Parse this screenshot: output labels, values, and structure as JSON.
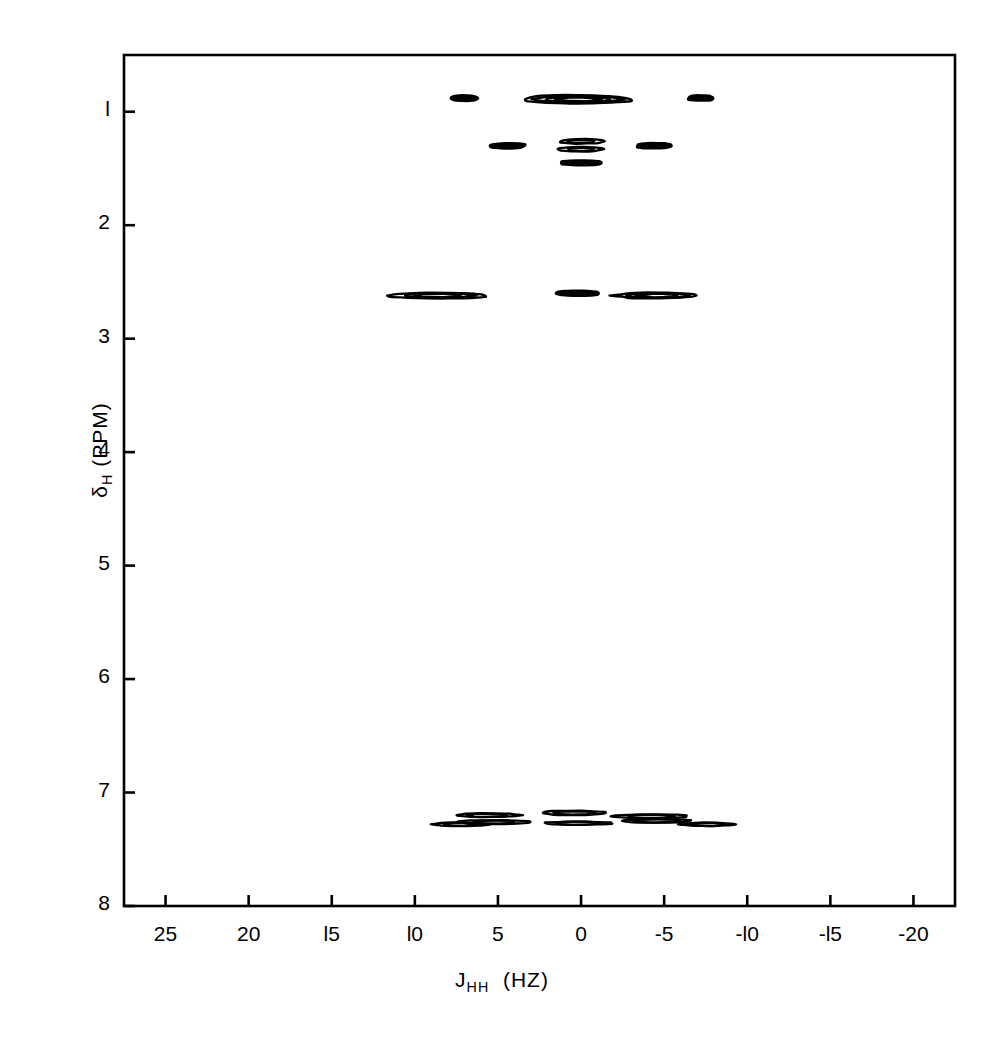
{
  "figure": {
    "domain": "chart",
    "background_color": "#ffffff",
    "line_color": "#000000"
  },
  "chart_data": {
    "type": "heatmap",
    "subtype": "2d-contour-nmr-j-resolved",
    "title": "",
    "subtitle": "",
    "xlabel_parts": {
      "symbol": "J",
      "subscript": "HH",
      "units": "(HZ)"
    },
    "xlabel": "J_HH (HZ)",
    "ylabel_parts": {
      "symbol": "δ",
      "subscript": "H",
      "units": "(PPM)"
    },
    "ylabel": "δ_H (PPM)",
    "xlim": [
      27.5,
      -22.5
    ],
    "ylim": [
      0.5,
      8.0
    ],
    "x_inverted": true,
    "y_inverted": true,
    "grid": false,
    "legend": false,
    "xticks": [
      25,
      20,
      15,
      10,
      5,
      0,
      -5,
      -10,
      -15,
      -20
    ],
    "xticklabels": [
      "25",
      "20",
      "l5",
      "l0",
      "5",
      "0",
      "-5",
      "-l0",
      "-l5",
      "-20"
    ],
    "yticks": [
      1,
      2,
      3,
      4,
      5,
      6,
      7,
      8
    ],
    "yticklabels": [
      "l",
      "2",
      "3",
      "4",
      "5",
      "6",
      "7",
      "8"
    ],
    "contour_levels": 4,
    "peaks": [
      {
        "label": "CH3-triplet-outer-left",
        "j": 7.0,
        "ppm": 0.88,
        "width_hz": 1.5,
        "height_ppm": 0.035,
        "rings": 1
      },
      {
        "label": "CH3-triplet-center",
        "j": 0.2,
        "ppm": 0.89,
        "width_hz": 6.5,
        "height_ppm": 0.075,
        "rings": 4
      },
      {
        "label": "CH3-triplet-outer-right",
        "j": -7.2,
        "ppm": 0.88,
        "width_hz": 1.5,
        "height_ppm": 0.035,
        "rings": 1
      },
      {
        "label": "CH2-multiplet-left",
        "j": 4.4,
        "ppm": 1.3,
        "width_hz": 2.0,
        "height_ppm": 0.035,
        "rings": 1
      },
      {
        "label": "CH2-multiplet-center-a",
        "j": 0.0,
        "ppm": 1.26,
        "width_hz": 2.6,
        "height_ppm": 0.042,
        "rings": 2
      },
      {
        "label": "CH2-multiplet-center-b",
        "j": 0.0,
        "ppm": 1.33,
        "width_hz": 2.6,
        "height_ppm": 0.042,
        "rings": 2
      },
      {
        "label": "CH2-multiplet-center-c",
        "j": 0.0,
        "ppm": 1.45,
        "width_hz": 2.3,
        "height_ppm": 0.03,
        "rings": 1
      },
      {
        "label": "CH2-multiplet-right",
        "j": -4.4,
        "ppm": 1.3,
        "width_hz": 2.0,
        "height_ppm": 0.035,
        "rings": 1
      },
      {
        "label": "CH2-benzylic-left",
        "j": 8.6,
        "ppm": 2.62,
        "width_hz": 5.8,
        "height_ppm": 0.05,
        "rings": 3
      },
      {
        "label": "CH2-benzylic-center",
        "j": 0.2,
        "ppm": 2.6,
        "width_hz": 2.6,
        "height_ppm": 0.032,
        "rings": 1
      },
      {
        "label": "CH2-benzylic-right",
        "j": -4.6,
        "ppm": 2.62,
        "width_hz": 5.2,
        "height_ppm": 0.052,
        "rings": 3
      },
      {
        "label": "aromatic-a",
        "j": 7.3,
        "ppm": 7.28,
        "width_hz": 3.4,
        "height_ppm": 0.03,
        "rings": 2
      },
      {
        "label": "aromatic-b",
        "j": 5.6,
        "ppm": 7.2,
        "width_hz": 4.0,
        "height_ppm": 0.033,
        "rings": 2
      },
      {
        "label": "aromatic-c",
        "j": 5.2,
        "ppm": 7.26,
        "width_hz": 4.2,
        "height_ppm": 0.033,
        "rings": 2
      },
      {
        "label": "aromatic-d",
        "j": 0.4,
        "ppm": 7.18,
        "width_hz": 3.8,
        "height_ppm": 0.04,
        "rings": 2
      },
      {
        "label": "aromatic-e",
        "j": 0.2,
        "ppm": 7.27,
        "width_hz": 4.2,
        "height_ppm": 0.028,
        "rings": 2
      },
      {
        "label": "aromatic-f",
        "j": -4.2,
        "ppm": 7.21,
        "width_hz": 4.6,
        "height_ppm": 0.036,
        "rings": 2
      },
      {
        "label": "aromatic-g",
        "j": -4.6,
        "ppm": 7.25,
        "width_hz": 4.4,
        "height_ppm": 0.03,
        "rings": 2
      },
      {
        "label": "aromatic-h",
        "j": -7.6,
        "ppm": 7.28,
        "width_hz": 3.2,
        "height_ppm": 0.027,
        "rings": 2
      }
    ]
  }
}
